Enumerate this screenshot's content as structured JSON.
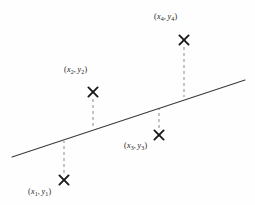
{
  "figure": {
    "type": "scatter-regression-diagram",
    "width": 255,
    "height": 205,
    "background_color": "#fefefe",
    "ink_color": "#1a1a1a",
    "line_color": "#3a3a3a",
    "dash_color": "#8a8a8a"
  },
  "regression_line": {
    "x1": 12,
    "y1": 157,
    "x2": 245,
    "y2": 80
  },
  "points": [
    {
      "id": "point-1",
      "marker_x": 64,
      "marker_y": 180,
      "line_y": 141,
      "label_x": 28,
      "label_y": 188,
      "x_var": "x",
      "x_sub": "1",
      "y_var": "y",
      "y_sub": "1",
      "open_paren": "(",
      "comma": ",",
      "close_paren": ")"
    },
    {
      "id": "point-2",
      "marker_x": 93,
      "marker_y": 92,
      "line_y": 128,
      "label_x": 64,
      "label_y": 66,
      "x_var": "x",
      "x_sub": "2",
      "y_var": "y",
      "y_sub": "2",
      "open_paren": "(",
      "comma": ",",
      "close_paren": ")"
    },
    {
      "id": "point-3",
      "marker_x": 159,
      "marker_y": 135,
      "line_y": 108,
      "label_x": 124,
      "label_y": 142,
      "x_var": "x",
      "x_sub": "3",
      "y_var": "y",
      "y_sub": "3",
      "open_paren": "(",
      "comma": ",",
      "close_paren": ")"
    },
    {
      "id": "point-4",
      "marker_x": 184,
      "marker_y": 40,
      "line_y": 97,
      "label_x": 154,
      "label_y": 13,
      "x_var": "x",
      "x_sub": "4",
      "y_var": "y",
      "y_sub": "4",
      "open_paren": "(",
      "comma": ",",
      "close_paren": ")"
    }
  ]
}
